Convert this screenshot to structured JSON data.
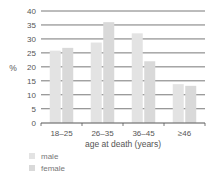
{
  "chart_data": {
    "type": "bar",
    "title": "",
    "xlabel": "age at death (years)",
    "ylabel": "%",
    "ylim": [
      0,
      40
    ],
    "yticks": [
      0,
      5,
      10,
      15,
      20,
      25,
      30,
      35,
      40
    ],
    "grid": true,
    "legend_position": "bottom-left",
    "categories": [
      "18–25",
      "26–35",
      "36–45",
      "≥46"
    ],
    "series": [
      {
        "name": "male",
        "color": "#e3e3e3",
        "values": [
          25.8,
          28.7,
          32.0,
          13.8
        ]
      },
      {
        "name": "female",
        "color": "#d9d9d9",
        "values": [
          26.8,
          36.0,
          22.0,
          13.2
        ]
      }
    ]
  },
  "legend": {
    "items": [
      {
        "label": "male",
        "color": "#e3e3e3"
      },
      {
        "label": "female",
        "color": "#d9d9d9"
      }
    ]
  }
}
